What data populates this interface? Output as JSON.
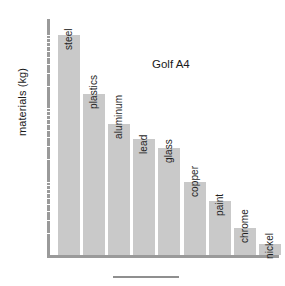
{
  "chart_data": {
    "type": "bar",
    "title": "Golf A4",
    "xlabel": "",
    "ylabel": "materials (kg)",
    "yscale": "log",
    "ylim": [
      1,
      1000
    ],
    "grid": false,
    "legend": "none",
    "categories": [
      "steel",
      "plastics",
      "aluminum",
      "lead",
      "glass",
      "copper",
      "paint",
      "chrome",
      "nickel"
    ],
    "values": [
      1000,
      155,
      60,
      38,
      29,
      10,
      5.5,
      2.3,
      1.4
    ],
    "tick_labels": [
      "10⁰",
      "10¹",
      "10²",
      "10³"
    ],
    "tick_values": [
      1,
      10,
      100,
      1000
    ],
    "bar_color": "#c9c9c9",
    "axis_color": "#9a9a9a",
    "text_color": "#1a1a1a"
  },
  "axis": {
    "ticks": [
      {
        "base": "10",
        "exp": "3",
        "value": 1000
      },
      {
        "base": "10",
        "exp": "2",
        "value": 100
      },
      {
        "base": "10",
        "exp": "1",
        "value": 10
      },
      {
        "base": "10",
        "exp": "0",
        "value": 1
      }
    ]
  },
  "bars": [
    {
      "label": "steel",
      "value": 1000
    },
    {
      "label": "plastics",
      "value": 155
    },
    {
      "label": "aluminum",
      "value": 60
    },
    {
      "label": "lead",
      "value": 38
    },
    {
      "label": "glass",
      "value": 29
    },
    {
      "label": "copper",
      "value": 10
    },
    {
      "label": "paint",
      "value": 5.5
    },
    {
      "label": "chrome",
      "value": 2.3
    },
    {
      "label": "nickel",
      "value": 1.4
    }
  ]
}
